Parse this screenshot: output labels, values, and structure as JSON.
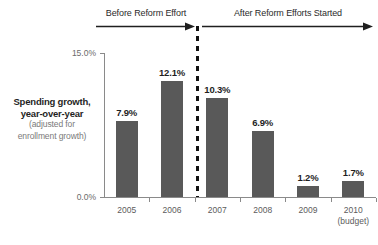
{
  "chart_data": {
    "type": "bar",
    "title": "",
    "subtitle": "",
    "xlabel": "",
    "ylabel": "Spending growth, year-over-year (adjusted for enrollment growth)",
    "categories": [
      "2005",
      "2006",
      "2007",
      "2008",
      "2009",
      "2010"
    ],
    "category_notes": [
      "",
      "",
      "",
      "",
      "",
      "(budget)"
    ],
    "values": [
      7.9,
      12.1,
      10.3,
      6.9,
      1.2,
      1.7
    ],
    "value_labels": [
      "7.9%",
      "12.1%",
      "10.3%",
      "6.9%",
      "1.2%",
      "1.7%"
    ],
    "ylim": [
      0,
      15
    ],
    "ytick_labels": [
      "0.0%",
      "15.0%"
    ],
    "ytick_values": [
      0,
      15
    ],
    "grid": false,
    "legend": "none",
    "bar_color": "#595959",
    "annotations": [
      {
        "text": "Before Reform Effort",
        "arrow": "right",
        "span_categories": [
          "2005",
          "2006"
        ]
      },
      {
        "text": "After Reform Efforts Started",
        "arrow": "right",
        "span_categories": [
          "2007",
          "2008",
          "2009",
          "2010"
        ]
      }
    ],
    "divider": {
      "position_after_category": "2006",
      "style": "dashed",
      "color": "#111111"
    }
  },
  "axis_title": {
    "line1": "Spending growth,",
    "line2": "year-over-year",
    "line3": "(adjusted for",
    "line4": "enrollment growth)"
  },
  "yaxis": {
    "top_label": "15.0%",
    "bottom_label": "0.0%"
  },
  "annotations": {
    "before": "Before Reform Effort",
    "after": "After Reform Efforts Started"
  },
  "bars": [
    {
      "category": "2005",
      "note": "",
      "value_label": "7.9%",
      "value": 7.9
    },
    {
      "category": "2006",
      "note": "",
      "value_label": "12.1%",
      "value": 12.1
    },
    {
      "category": "2007",
      "note": "",
      "value_label": "10.3%",
      "value": 10.3
    },
    {
      "category": "2008",
      "note": "",
      "value_label": "6.9%",
      "value": 6.9
    },
    {
      "category": "2009",
      "note": "",
      "value_label": "1.2%",
      "value": 1.2
    },
    {
      "category": "2010",
      "note": "(budget)",
      "value_label": "1.7%",
      "value": 1.7
    }
  ],
  "colors": {
    "bar": "#595959",
    "axis": "#8a8a8a",
    "text": "#1f1f1f",
    "muted": "#7a7a7a",
    "divider": "#111111"
  }
}
